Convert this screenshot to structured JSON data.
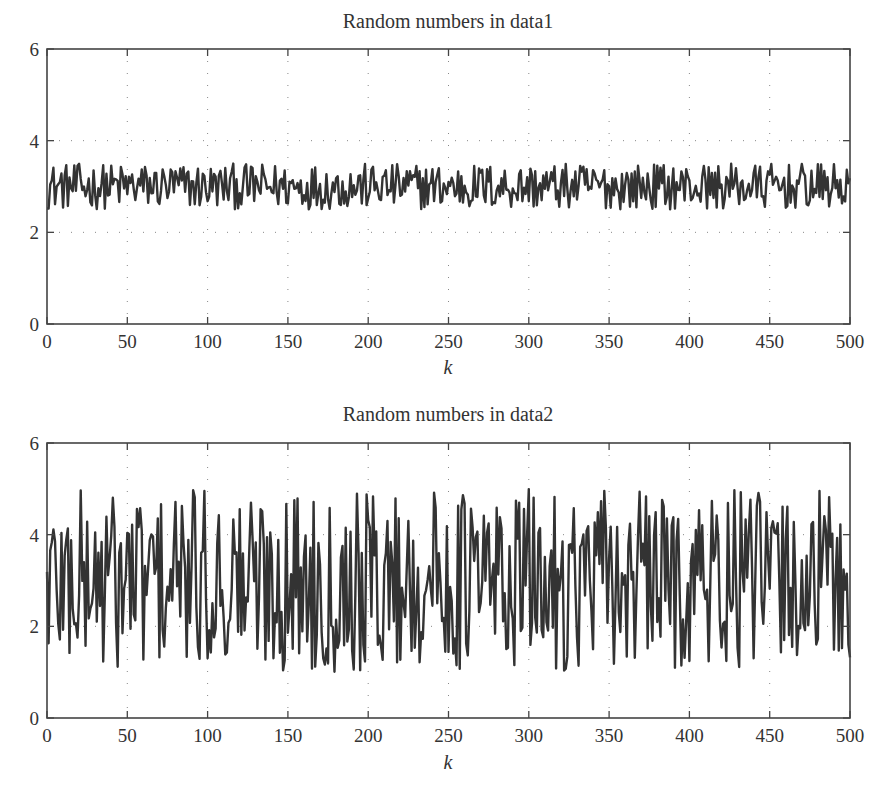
{
  "figure": {
    "background": "#ffffff",
    "line_color": "#333333",
    "axis_color": "#444444",
    "grid_color": "#888888"
  },
  "chart_data": [
    {
      "type": "line",
      "title": "Random numbers in data1",
      "xlabel": "k",
      "ylabel": "",
      "xlim": [
        0,
        500
      ],
      "ylim": [
        0,
        6
      ],
      "xticks": [
        0,
        50,
        100,
        150,
        200,
        250,
        300,
        350,
        400,
        450,
        500
      ],
      "yticks": [
        0,
        2,
        4,
        6
      ],
      "grid": true,
      "grid_style": "dotted",
      "legend": null,
      "series": [
        {
          "name": "data1",
          "n_points": 501,
          "x_start": 0,
          "x_step": 1,
          "value_min": 2.5,
          "value_max": 3.5,
          "mean": 3.0,
          "generator": {
            "kind": "uniform",
            "seed": 12345,
            "low": 2.5,
            "high": 3.5
          },
          "sampled_values": {
            "k": [
              0,
              25,
              50,
              75,
              100,
              125,
              150,
              175,
              200,
              225,
              250,
              275,
              300,
              325,
              350,
              375,
              400,
              425,
              450,
              475,
              500
            ],
            "y": [
              2.6,
              3.3,
              2.8,
              3.1,
              2.7,
              3.2,
              3.4,
              2.9,
              3.1,
              2.7,
              3.4,
              2.6,
              3.2,
              2.9,
              2.5,
              3.3,
              3.0,
              2.8,
              3.1,
              2.7,
              2.8
            ]
          }
        }
      ],
      "box_px": {
        "left": 47,
        "right": 850,
        "top": 49,
        "bottom": 324
      }
    },
    {
      "type": "line",
      "title": "Random numbers in data2",
      "xlabel": "k",
      "ylabel": "",
      "xlim": [
        0,
        500
      ],
      "ylim": [
        0,
        6
      ],
      "xticks": [
        0,
        50,
        100,
        150,
        200,
        250,
        300,
        350,
        400,
        450,
        500
      ],
      "yticks": [
        0,
        2,
        4,
        6
      ],
      "grid": true,
      "grid_style": "dotted",
      "legend": null,
      "series": [
        {
          "name": "data2",
          "n_points": 501,
          "x_start": 0,
          "x_step": 1,
          "value_min": 1.0,
          "value_max": 5.0,
          "mean": 3.0,
          "generator": {
            "kind": "uniform",
            "seed": 67890,
            "low": 1.0,
            "high": 5.0
          },
          "sampled_values": {
            "k": [
              0,
              25,
              50,
              75,
              100,
              125,
              150,
              175,
              200,
              225,
              250,
              275,
              300,
              325,
              350,
              375,
              400,
              425,
              450,
              475,
              500
            ],
            "y": [
              2.0,
              1.1,
              5.0,
              1.2,
              1.9,
              4.6,
              1.0,
              4.9,
              3.2,
              1.1,
              1.5,
              4.8,
              1.8,
              4.7,
              4.5,
              1.0,
              5.0,
              1.1,
              4.9,
              1.0,
              2.6
            ]
          }
        }
      ],
      "box_px": {
        "left": 47,
        "right": 850,
        "top": 443,
        "bottom": 718
      }
    }
  ]
}
